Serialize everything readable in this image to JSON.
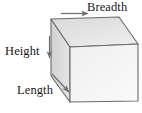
{
  "figure": {
    "shape": "cuboid",
    "background_color": "#ffffff",
    "outline_color": "#6b6b6b",
    "arrow_color": "#6f6f6f",
    "text_color": "#17171a",
    "faces": {
      "top": {
        "name": "top-face",
        "fill": "#e3e3e3"
      },
      "left": {
        "name": "left-face",
        "fill": "#dcdcdc"
      },
      "front": {
        "name": "front-face",
        "fill": "#f3f3f3"
      }
    },
    "labels": {
      "breadth": "Breadth",
      "height": "Height",
      "length": "Length"
    },
    "arrows": [
      {
        "name": "breadth-arrow",
        "direction": "right",
        "label": "Breadth"
      },
      {
        "name": "height-arrow",
        "direction": "down",
        "label": "Height"
      },
      {
        "name": "length-arrow",
        "direction": "down-right",
        "label": "Length"
      }
    ]
  }
}
